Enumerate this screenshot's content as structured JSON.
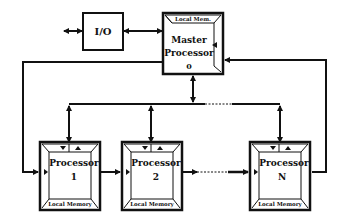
{
  "diagram": {
    "io": {
      "label": "I/O"
    },
    "master": {
      "line1": "Master",
      "line2": "Processor",
      "line3": "0",
      "memory": "Local Mem."
    },
    "processors": [
      {
        "line1": "Processor",
        "line2": "1",
        "memory": "Local Memory"
      },
      {
        "line1": "Processor",
        "line2": "2",
        "memory": "Local Memory"
      },
      {
        "line1": "Processor",
        "line2": "N",
        "memory": "Local Memory"
      }
    ],
    "colors": {
      "ink": "#111111",
      "background": "#ffffff"
    }
  }
}
